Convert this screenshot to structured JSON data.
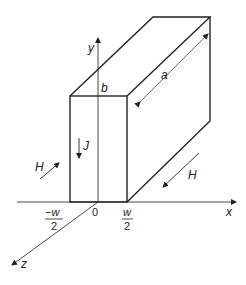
{
  "diagram": {
    "colors": {
      "stroke": "#222222",
      "background": "#ffffff"
    },
    "labels": {
      "y_axis": "y",
      "x_axis": "x",
      "z_axis": "z",
      "height": "b",
      "length": "a",
      "current_density": "J",
      "field_left": "H",
      "field_right": "H",
      "origin": "0",
      "left_edge_num": "−w",
      "left_edge_den": "2",
      "right_edge_num": "w",
      "right_edge_den": "2"
    }
  }
}
